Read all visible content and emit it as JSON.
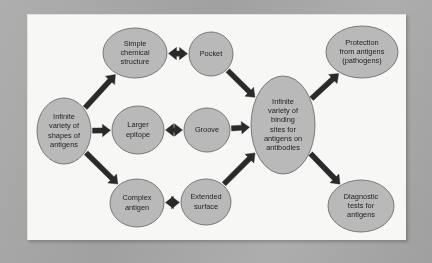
{
  "figure": {
    "kind": "flow-diagram",
    "panel_background": "#f7f7f5",
    "surround_background": "#a9a9a9",
    "node_fill": "#b9b9b9",
    "node_stroke": "#6d6d6d",
    "arrow_color": "#2a2a2a"
  },
  "nodes": [
    {
      "id": "antigen-shapes",
      "lines": [
        "Infinite",
        "variety of",
        "shapes of",
        "antigens"
      ],
      "cx": 64,
      "cy": 131,
      "rx": 27,
      "ry": 33
    },
    {
      "id": "simple-chemical-structure",
      "lines": [
        "Simple",
        "chemical",
        "structure"
      ],
      "cx": 135,
      "cy": 53,
      "rx": 32,
      "ry": 25
    },
    {
      "id": "larger-epitope",
      "lines": [
        "Larger",
        "epitope"
      ],
      "cx": 138,
      "cy": 130,
      "rx": 26,
      "ry": 24
    },
    {
      "id": "complex-antigen",
      "lines": [
        "Complex",
        "antigen"
      ],
      "cx": 137,
      "cy": 203,
      "rx": 27,
      "ry": 24
    },
    {
      "id": "pocket",
      "lines": [
        "Pocket"
      ],
      "cx": 211,
      "cy": 54,
      "rx": 22,
      "ry": 22
    },
    {
      "id": "groove",
      "lines": [
        "Groove"
      ],
      "cx": 207,
      "cy": 130,
      "rx": 23,
      "ry": 22
    },
    {
      "id": "extended-surface",
      "lines": [
        "Extended",
        "surface"
      ],
      "cx": 206,
      "cy": 202,
      "rx": 25,
      "ry": 23
    },
    {
      "id": "binding-sites",
      "lines": [
        "Infinite",
        "variety of",
        "binding",
        "sites for",
        "antigens on",
        "antibodies"
      ],
      "cx": 283,
      "cy": 125,
      "rx": 32,
      "ry": 49
    },
    {
      "id": "protection",
      "lines": [
        "Protection",
        "from antigens",
        "(pathogens)"
      ],
      "cx": 362,
      "cy": 52,
      "rx": 36,
      "ry": 26
    },
    {
      "id": "diagnostic-tests",
      "lines": [
        "Diagnostic",
        "tests for",
        "antigens"
      ],
      "cx": 361,
      "cy": 206,
      "rx": 33,
      "ry": 26
    }
  ],
  "edges": [
    {
      "id": "antigen-to-simple",
      "from": "antigen-shapes",
      "to": "simple-chemical-structure",
      "heads": "single"
    },
    {
      "id": "antigen-to-epitope",
      "from": "antigen-shapes",
      "to": "larger-epitope",
      "heads": "single"
    },
    {
      "id": "antigen-to-complex",
      "from": "antigen-shapes",
      "to": "complex-antigen",
      "heads": "single"
    },
    {
      "id": "simple-to-pocket",
      "from": "simple-chemical-structure",
      "to": "pocket",
      "heads": "double"
    },
    {
      "id": "epitope-to-groove",
      "from": "larger-epitope",
      "to": "groove",
      "heads": "double"
    },
    {
      "id": "complex-to-extended",
      "from": "complex-antigen",
      "to": "extended-surface",
      "heads": "double"
    },
    {
      "id": "pocket-to-binding",
      "from": "pocket",
      "to": "binding-sites",
      "heads": "single"
    },
    {
      "id": "groove-to-binding",
      "from": "groove",
      "to": "binding-sites",
      "heads": "single"
    },
    {
      "id": "extended-to-binding",
      "from": "extended-surface",
      "to": "binding-sites",
      "heads": "single"
    },
    {
      "id": "binding-to-protection",
      "from": "binding-sites",
      "to": "protection",
      "heads": "single"
    },
    {
      "id": "binding-to-diagnostic",
      "from": "binding-sites",
      "to": "diagnostic-tests",
      "heads": "single"
    }
  ]
}
